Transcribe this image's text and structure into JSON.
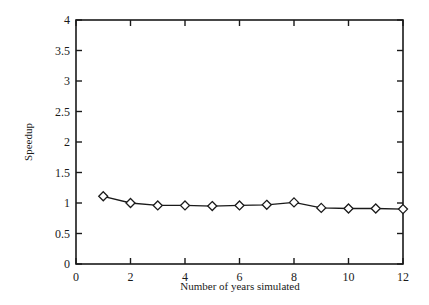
{
  "chart_data": {
    "type": "line",
    "title": "",
    "xlabel": "Number of years simulated",
    "ylabel": "Speedup",
    "xlim": [
      0,
      12
    ],
    "ylim": [
      0,
      4
    ],
    "x_ticks": [
      0,
      2,
      4,
      6,
      8,
      10,
      12
    ],
    "x_tick_labels": [
      "0",
      "2",
      "4",
      "6",
      "8",
      "10",
      "12"
    ],
    "y_ticks": [
      0,
      0.5,
      1,
      1.5,
      2,
      2.5,
      3,
      3.5,
      4
    ],
    "y_tick_labels": [
      "0",
      "0.5",
      "1",
      "1.5",
      "2",
      "2.5",
      "3",
      "3.5",
      "4"
    ],
    "grid": false,
    "legend": null,
    "series": [
      {
        "name": "Speedup",
        "marker": "diamond-open",
        "color": "#1a1a1a",
        "x": [
          1,
          2,
          3,
          4,
          5,
          6,
          7,
          8,
          9,
          10,
          11,
          12
        ],
        "values": [
          1.11,
          1.0,
          0.96,
          0.96,
          0.95,
          0.96,
          0.97,
          1.01,
          0.92,
          0.91,
          0.91,
          0.9
        ]
      }
    ]
  }
}
